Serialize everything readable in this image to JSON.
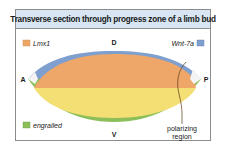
{
  "title": "Transverse section through progress zone of a limb bud",
  "axes": {
    "dorsal": "D",
    "ventral": "V",
    "anterior": "A",
    "posterior": "P"
  },
  "legend": [
    {
      "label": "Lmx1",
      "color": "#eea768",
      "position": "top-left"
    },
    {
      "label": "Wnt-7a",
      "color": "#7f9fcf",
      "position": "top-right"
    },
    {
      "label": "engrailed",
      "color": "#8cbf5a",
      "position": "bottom-left"
    }
  ],
  "annotation": {
    "line1": "polarizing",
    "line2": "region"
  },
  "colors": {
    "header_bg": "#d7e6f2",
    "border": "#8c8c8c",
    "dorsal_mesoderm": "#eea768",
    "ventral_mesoderm": "#f3df73",
    "dorsal_ectoderm": "#7f9fcf",
    "ventral_ectoderm": "#8cbf5a",
    "ridge": "#ffffff"
  }
}
